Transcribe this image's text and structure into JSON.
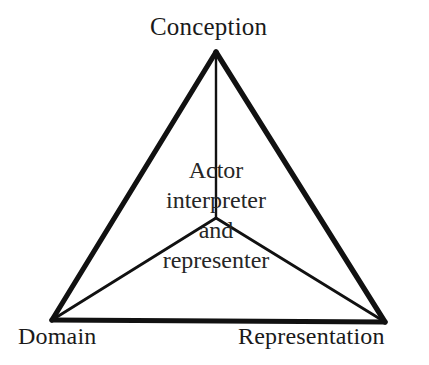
{
  "diagram": {
    "type": "semiotic-triangle",
    "background_color": "#ffffff",
    "stroke_color": "#111111",
    "text_color": "#1a1a1a",
    "outer_stroke_width": 5,
    "inner_stroke_width": 2,
    "vertices": {
      "apex": {
        "label": "Conception",
        "x": 216,
        "y": 52
      },
      "bottom_left": {
        "label": "Domain",
        "x": 52,
        "y": 320
      },
      "bottom_right": {
        "label": "Representation",
        "x": 385,
        "y": 322
      }
    },
    "center_node": {
      "x": 216,
      "y": 218,
      "lines": [
        "Actor",
        "interpreter",
        "and",
        "representer"
      ]
    },
    "edges": [
      {
        "name": "apex-to-bottom-left",
        "from": "apex",
        "to": "bottom_left",
        "weight": "thick"
      },
      {
        "name": "apex-to-bottom-right",
        "from": "apex",
        "to": "bottom_right",
        "weight": "thick"
      },
      {
        "name": "bottom-left-to-bottom-right",
        "from": "bottom_left",
        "to": "bottom_right",
        "weight": "thick"
      },
      {
        "name": "center-to-apex",
        "from": "center_node",
        "to": "apex",
        "weight": "thin"
      },
      {
        "name": "center-to-bottom-left",
        "from": "center_node",
        "to": "bottom_left",
        "weight": "thin"
      },
      {
        "name": "center-to-bottom-right",
        "from": "center_node",
        "to": "bottom_right",
        "weight": "thin"
      }
    ]
  },
  "labels": {
    "conception": "Conception",
    "domain": "Domain",
    "representation": "Representation"
  },
  "center_text": {
    "line1": "Actor",
    "line2": "interpreter",
    "line3": "and",
    "line4": "representer"
  }
}
